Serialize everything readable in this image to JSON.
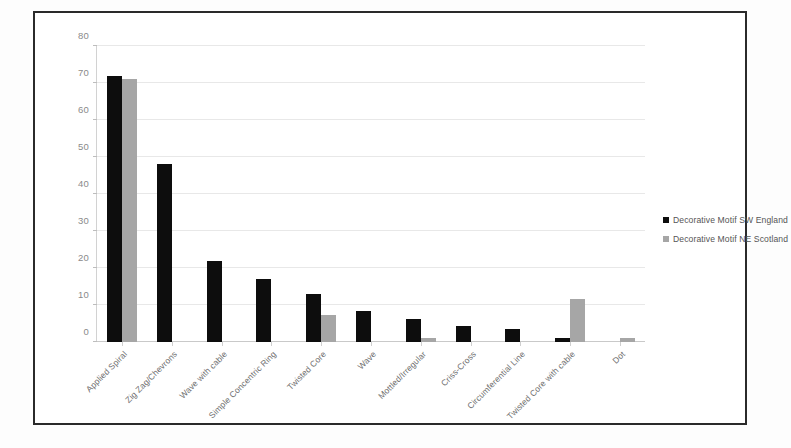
{
  "chart_data": {
    "type": "bar",
    "title": "",
    "xlabel": "",
    "ylabel": "",
    "ylim": [
      0,
      80
    ],
    "yticks": [
      0,
      10,
      20,
      30,
      40,
      50,
      60,
      70,
      80
    ],
    "grid": true,
    "legend_position": "right",
    "categories": [
      "Applied Spiral",
      "Zig Zag/Chevrons",
      "Wave with cable",
      "Simple Concentric Ring",
      "Twisted Core",
      "Wave",
      "Mottled/Irregular",
      "Criss-Cross",
      "Circumferential Line",
      "Twisted Core with cable",
      "Dot"
    ],
    "series": [
      {
        "name": "Decorative Motif SW England",
        "color": "#0d0d0d",
        "values": [
          72,
          48,
          22,
          17,
          13,
          8.5,
          6.3,
          4.2,
          3.5,
          1.2,
          0
        ]
      },
      {
        "name": "Decorative Motif NE Scotland",
        "color": "#a6a6a6",
        "values": [
          71,
          0,
          0,
          0,
          7.4,
          0,
          1,
          0,
          0,
          11.5,
          1
        ]
      }
    ]
  }
}
